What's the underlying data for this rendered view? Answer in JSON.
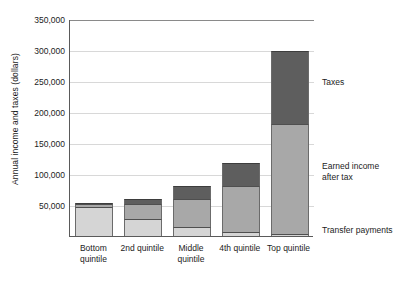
{
  "chart_data": {
    "type": "bar",
    "subtype": "stacked-bar",
    "title": "",
    "xlabel": "",
    "ylabel": "Annual income and taxes (dollars)",
    "categories": [
      "Bottom quintile",
      "2nd quintile",
      "Middle quintile",
      "4th quintile",
      "Top quintile"
    ],
    "category_lines": [
      [
        "Bottom",
        "quintile"
      ],
      [
        "2nd quintile"
      ],
      [
        "Middle",
        "quintile"
      ],
      [
        "4th quintile"
      ],
      [
        "Top quintile"
      ]
    ],
    "series": [
      {
        "name": "Transfer payments",
        "color": "#d5d5d5",
        "values": [
          46000,
          28000,
          14000,
          6000,
          4000
        ]
      },
      {
        "name": "Earned income after tax",
        "color": "#a8a8a8",
        "values": [
          5000,
          24000,
          46000,
          74000,
          176000
        ]
      },
      {
        "name": "Taxes",
        "color": "#5e5e5e",
        "values": [
          2000,
          7000,
          20000,
          38000,
          119000
        ]
      }
    ],
    "totals": [
      53000,
      59000,
      80000,
      118000,
      299000
    ],
    "ylim": [
      0,
      350000
    ],
    "ytick_values": [
      50000,
      100000,
      150000,
      200000,
      250000,
      300000,
      350000
    ],
    "ytick_labels": [
      "50,000",
      "100,000",
      "150,000",
      "200,000",
      "250,000",
      "300,000",
      "350,000"
    ],
    "grid": true,
    "legend_position": "right-inline",
    "annotations": [
      {
        "label": "Taxes",
        "lines": [
          "Taxes"
        ],
        "value": 250000
      },
      {
        "label": "Earned income after tax",
        "lines": [
          "Earned income",
          "after tax"
        ],
        "value": 105000
      },
      {
        "label": "Transfer payments",
        "lines": [
          "Transfer payments"
        ],
        "value": 10000
      }
    ]
  }
}
